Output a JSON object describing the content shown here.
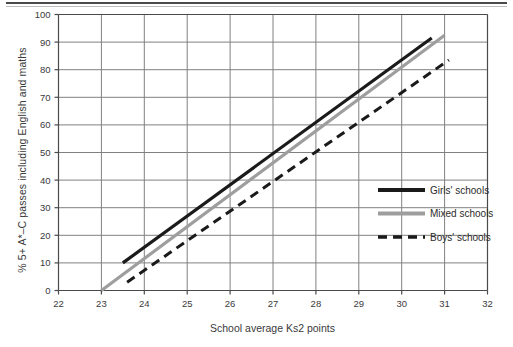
{
  "chart_data": {
    "type": "line",
    "title": "",
    "xlabel": "School average Ks2 points",
    "ylabel": "% 5+ A*–C passes including English and maths",
    "xlim": [
      22,
      32
    ],
    "ylim": [
      0,
      100
    ],
    "xticks": [
      "22",
      "23",
      "24",
      "25",
      "26",
      "27",
      "28",
      "29",
      "30",
      "31",
      "32"
    ],
    "yticks": [
      "0",
      "10",
      "20",
      "30",
      "40",
      "50",
      "60",
      "70",
      "80",
      "90",
      "100"
    ],
    "grid": true,
    "legend_position": "inside-right",
    "series": [
      {
        "name": "Girls' schools",
        "style": "solid",
        "color": "#1a1a1a",
        "width": 3.2,
        "points": [
          [
            23.5,
            10.0
          ],
          [
            30.7,
            91.5
          ]
        ]
      },
      {
        "name": "Mixed schools",
        "style": "solid",
        "color": "#9e9e9e",
        "width": 3.2,
        "points": [
          [
            23.0,
            0.0
          ],
          [
            31.0,
            92.5
          ]
        ]
      },
      {
        "name": "Boys' schools",
        "style": "dashed",
        "color": "#1a1a1a",
        "width": 3.0,
        "points": [
          [
            23.6,
            3.0
          ],
          [
            31.1,
            83.5
          ]
        ]
      }
    ]
  },
  "legend": {
    "items": [
      {
        "label": "Girls' schools"
      },
      {
        "label": "Mixed schools"
      },
      {
        "label": "Boys' schools"
      }
    ]
  },
  "axes": {
    "x_title": "School average Ks2 points",
    "y_title": "% 5+ A*–C passes including English and maths"
  },
  "colors": {
    "girls": "#1a1a1a",
    "mixed": "#9e9e9e",
    "boys": "#1a1a1a",
    "grid": "#808080",
    "axis": "#4a4a4a",
    "text": "#3a3a3a",
    "background": "#ffffff"
  }
}
